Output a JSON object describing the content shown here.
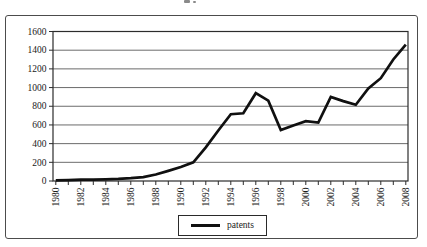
{
  "chart_data": {
    "type": "line",
    "title": "",
    "xlabel": "",
    "ylabel": "",
    "x": [
      1980,
      1981,
      1982,
      1983,
      1984,
      1985,
      1986,
      1987,
      1988,
      1989,
      1990,
      1991,
      1992,
      1993,
      1994,
      1995,
      1996,
      1997,
      1998,
      1999,
      2000,
      2001,
      2002,
      2003,
      2004,
      2005,
      2006,
      2007,
      2008
    ],
    "x_tick_labels": [
      "1980",
      "1982",
      "1984",
      "1986",
      "1988",
      "1990",
      "1992",
      "1994",
      "1996",
      "1998",
      "2000",
      "2002",
      "2004",
      "2006",
      "2008"
    ],
    "y_ticks": [
      0,
      200,
      400,
      600,
      800,
      1000,
      1200,
      1400,
      1600
    ],
    "y_tick_labels": [
      "0",
      "200",
      "400",
      "600",
      "800",
      "1000",
      "1200",
      "1400",
      "1600"
    ],
    "ylim": [
      0,
      1600
    ],
    "grid": "horizontal",
    "legend_position": "bottom-center",
    "series": [
      {
        "name": "patents",
        "color": "#101010",
        "values": [
          8,
          10,
          14,
          14,
          18,
          22,
          30,
          42,
          70,
          108,
          150,
          200,
          360,
          540,
          715,
          725,
          940,
          860,
          545,
          595,
          640,
          625,
          900,
          855,
          815,
          990,
          1100,
          1300,
          1460
        ]
      }
    ]
  },
  "legend": {
    "label": "patents"
  },
  "colors": {
    "axis": "#2c2c2c",
    "gridline": "#5a5a5a",
    "tick_label": "#1a1a1a"
  }
}
